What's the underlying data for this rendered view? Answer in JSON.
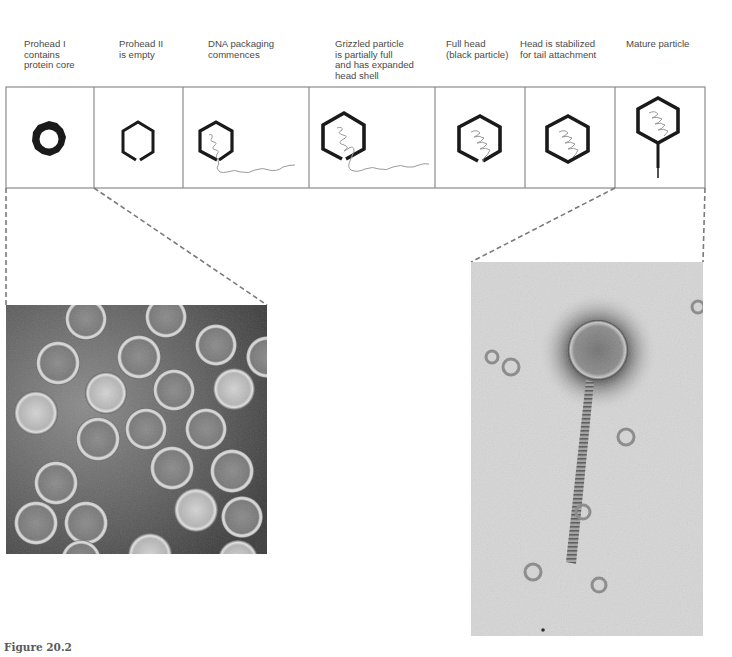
{
  "figure": {
    "caption": "Figure 20.2",
    "stages": [
      {
        "label": "Prohead I\ncontains\nprotein core",
        "icon": "prohead-i-ring-icon"
      },
      {
        "label": "Prohead II\nis empty",
        "icon": "prohead-ii-empty-hexagon-icon"
      },
      {
        "label": "DNA packaging\ncommences",
        "icon": "dna-packaging-hexagon-icon"
      },
      {
        "label": "Grizzled particle\nis partially full\nand has expanded\nhead shell",
        "icon": "grizzled-particle-hexagon-icon"
      },
      {
        "label": "Full head\n(black particle)",
        "icon": "full-head-hexagon-icon"
      },
      {
        "label": "Head is stabilized\nfor tail attachment",
        "icon": "stabilized-head-hexagon-icon"
      },
      {
        "label": "Mature particle",
        "icon": "mature-particle-phage-icon"
      }
    ],
    "micrographs": [
      {
        "name": "prohead-micrograph",
        "description": "Electron micrograph of proheads"
      },
      {
        "name": "mature-phage-micrograph",
        "description": "Electron micrograph of mature phage particle"
      }
    ],
    "colors": {
      "box_border": "#8a8a8a",
      "shell": "#1a1a1a",
      "dna": "#9a9a9a",
      "dashed_line": "#7a7a7a",
      "label_text": "#4a4a4a"
    }
  }
}
